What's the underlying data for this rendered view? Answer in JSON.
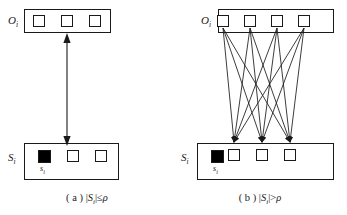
{
  "figure": {
    "panels": [
      {
        "id": "a",
        "caption_prefix": "( a )",
        "caption_expr_open": "|",
        "caption_set": "S",
        "caption_set_sub": "i",
        "caption_expr_close": "|",
        "caption_relation": "≤",
        "caption_rho": "ρ",
        "top_set_label": "O",
        "top_set_label_sub": "i",
        "bottom_set_label": "S",
        "bottom_set_label_sub": "i",
        "top_node_count": 3,
        "bottom_filled_label": "s",
        "bottom_filled_label_sub": "i",
        "bottom_white_count": 2,
        "connection_style": "double-headed-arrow"
      },
      {
        "id": "b",
        "caption_prefix": "( b )",
        "caption_expr_open": "|",
        "caption_set": "S",
        "caption_set_sub": "i",
        "caption_expr_close": "|",
        "caption_relation": ">",
        "caption_rho": "ρ",
        "top_set_label": "O",
        "top_set_label_sub": "i",
        "bottom_set_label": "S",
        "bottom_set_label_sub": "i",
        "top_node_count": 4,
        "bottom_filled_label": "s",
        "bottom_filled_label_sub": "i",
        "bottom_white_count": 3,
        "connection_style": "bipartite-arrows"
      }
    ],
    "colors": {
      "stroke": "#1a1a1a",
      "fill_empty": "#ffffff",
      "fill_solid": "#000000",
      "background": "#ffffff"
    }
  }
}
